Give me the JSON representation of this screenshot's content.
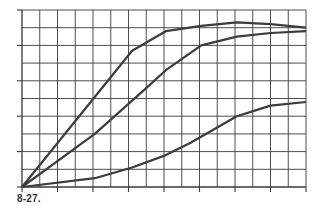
{
  "chart_data": {
    "type": "line",
    "title": "",
    "caption": "8-27.",
    "xlabel": "",
    "ylabel": "",
    "xlim": [
      0,
      16
    ],
    "ylim": [
      0,
      10
    ],
    "grid": true,
    "x_gridlines": 16,
    "y_gridlines": 10,
    "x_tick_every": 2,
    "y_tick_every": 2,
    "tick_labels": "none",
    "legend": "none",
    "series": [
      {
        "name": "curve-1",
        "points": [
          [
            0,
            0
          ],
          [
            6.2,
            7.7
          ],
          [
            8.1,
            8.8
          ],
          [
            10.1,
            9.1
          ],
          [
            12.1,
            9.3
          ],
          [
            14,
            9.2
          ],
          [
            16,
            9.0
          ]
        ]
      },
      {
        "name": "curve-2",
        "points": [
          [
            0,
            0
          ],
          [
            4.1,
            3.0
          ],
          [
            6.9,
            5.5
          ],
          [
            8.1,
            6.6
          ],
          [
            10.1,
            8.0
          ],
          [
            12.1,
            8.5
          ],
          [
            14,
            8.7
          ],
          [
            16,
            8.8
          ]
        ]
      },
      {
        "name": "curve-3",
        "points": [
          [
            0,
            0
          ],
          [
            4.1,
            0.5
          ],
          [
            6.2,
            1.1
          ],
          [
            8.1,
            1.8
          ],
          [
            9.5,
            2.5
          ],
          [
            12.1,
            4.0
          ],
          [
            14,
            4.6
          ],
          [
            16,
            4.8
          ]
        ]
      }
    ]
  },
  "caption": "8-27.",
  "colors": {
    "grid": "#3a3a3a",
    "line": "#3c3c3c",
    "background": "#ffffff"
  }
}
